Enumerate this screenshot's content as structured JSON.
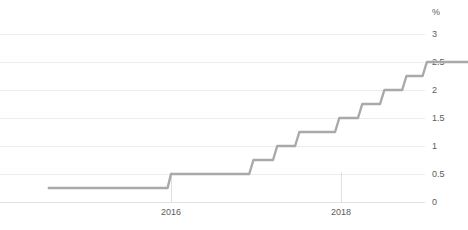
{
  "title": "",
  "chart_data": {
    "type": "line",
    "title": "",
    "subtitle": "",
    "xlabel": "",
    "ylabel": "",
    "y_unit": "%",
    "grid": true,
    "legend": "none",
    "line_style": "step-post",
    "series_color": "#a9a9a9",
    "grid_color": "#ececec",
    "ylim": [
      0,
      3
    ],
    "yticks": [
      0,
      0.5,
      1,
      1.5,
      2,
      2.5,
      3
    ],
    "ytick_labels": [
      "0",
      "0.5",
      "1",
      "1.5",
      "2",
      "2.5",
      "3"
    ],
    "xlim": [
      2014.55,
      2019.6
    ],
    "xticks": [
      2016,
      2018
    ],
    "xtick_labels": [
      "2016",
      "2018"
    ],
    "series": [
      {
        "name": "Policy rate",
        "values": [
          {
            "x": 2014.55,
            "y": 0.25
          },
          {
            "x": 2015.96,
            "y": 0.25
          },
          {
            "x": 2016.0,
            "y": 0.5
          },
          {
            "x": 2016.92,
            "y": 0.5
          },
          {
            "x": 2016.97,
            "y": 0.75
          },
          {
            "x": 2017.2,
            "y": 0.75
          },
          {
            "x": 2017.25,
            "y": 1.0
          },
          {
            "x": 2017.46,
            "y": 1.0
          },
          {
            "x": 2017.51,
            "y": 1.25
          },
          {
            "x": 2017.93,
            "y": 1.25
          },
          {
            "x": 2017.98,
            "y": 1.5
          },
          {
            "x": 2018.2,
            "y": 1.5
          },
          {
            "x": 2018.25,
            "y": 1.75
          },
          {
            "x": 2018.46,
            "y": 1.75
          },
          {
            "x": 2018.51,
            "y": 2.0
          },
          {
            "x": 2018.72,
            "y": 2.0
          },
          {
            "x": 2018.77,
            "y": 2.25
          },
          {
            "x": 2018.96,
            "y": 2.25
          },
          {
            "x": 2019.01,
            "y": 2.5
          },
          {
            "x": 2019.6,
            "y": 2.5
          }
        ]
      }
    ]
  }
}
